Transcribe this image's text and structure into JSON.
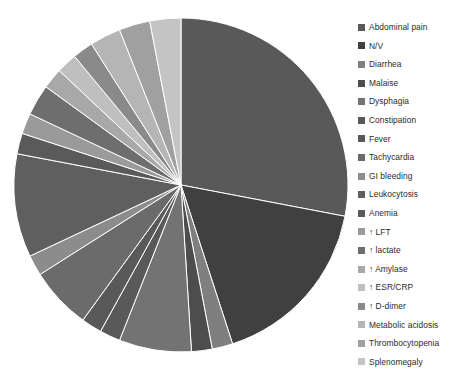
{
  "chart_data": {
    "type": "pie",
    "title": "",
    "legend_position": "right",
    "start_angle_deg": 0,
    "direction": "clockwise",
    "categories": [
      "Abdominal pain",
      "N/V",
      "Diarrhea",
      "Malaise",
      "Dysphagia",
      "Constipation",
      "Fever",
      "Tachycardia",
      "GI bleeding",
      "Leukocytosis",
      "Anemia",
      "↑ LFT",
      "↑ lactate",
      "↑ Amylase",
      "↑ ESR/CRP",
      "↑ D-dimer",
      "Metabolic acidosis",
      "Thrombocytopenia",
      "Splenomegaly"
    ],
    "values": [
      28,
      17,
      2,
      2,
      7,
      2,
      2,
      6,
      2,
      10,
      2,
      2,
      3,
      2,
      2,
      2,
      3,
      3,
      3
    ],
    "colors": [
      "#595959",
      "#404040",
      "#7f7f7f",
      "#4d4d4d",
      "#737373",
      "#595959",
      "#595959",
      "#6b6b6b",
      "#8c8c8c",
      "#5f5f5f",
      "#5a5a5a",
      "#9a9a9a",
      "#6e6e6e",
      "#a8a8a8",
      "#bfbfbf",
      "#8a8a8a",
      "#b5b5b5",
      "#a0a0a0",
      "#c4c4c4"
    ],
    "geometry": {
      "center_x": 181,
      "center_y": 185,
      "radius": 167
    }
  },
  "legend": {
    "items": [
      {
        "label": "Abdominal pain",
        "color": "#595959"
      },
      {
        "label": "N/V",
        "color": "#404040"
      },
      {
        "label": "Diarrhea",
        "color": "#7f7f7f"
      },
      {
        "label": "Malaise",
        "color": "#4d4d4d"
      },
      {
        "label": "Dysphagia",
        "color": "#737373"
      },
      {
        "label": "Constipation",
        "color": "#595959"
      },
      {
        "label": "Fever",
        "color": "#595959"
      },
      {
        "label": "Tachycardia",
        "color": "#6b6b6b"
      },
      {
        "label": "GI bleeding",
        "color": "#8c8c8c"
      },
      {
        "label": "Leukocytosis",
        "color": "#5f5f5f"
      },
      {
        "label": "Anemia",
        "color": "#5a5a5a"
      },
      {
        "label": "↑ LFT",
        "color": "#9a9a9a"
      },
      {
        "label": "↑ lactate",
        "color": "#6e6e6e"
      },
      {
        "label": "↑ Amylase",
        "color": "#a8a8a8"
      },
      {
        "label": "↑ ESR/CRP",
        "color": "#bfbfbf"
      },
      {
        "label": "↑ D-dimer",
        "color": "#8a8a8a"
      },
      {
        "label": "Metabolic acidosis",
        "color": "#b5b5b5"
      },
      {
        "label": "Thrombocytopenia",
        "color": "#a0a0a0"
      },
      {
        "label": "Splenomegaly",
        "color": "#c4c4c4"
      }
    ]
  }
}
